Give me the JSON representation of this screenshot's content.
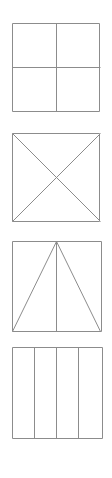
{
  "figure": {
    "background_color": "#ffffff",
    "line_color": "#8c8c8c",
    "line_width": 1,
    "canvas": {
      "width": 112,
      "height": 478
    },
    "panels": [
      {
        "id": "square-quartered",
        "label": "Square divided into four equal quarters",
        "partition_type": "cross",
        "parts": 4,
        "square": {
          "x": 12,
          "y": 23,
          "size": 88
        },
        "lines": [
          {
            "name": "vertical-center-line",
            "x1": 56,
            "y1": 23,
            "x2": 56,
            "y2": 111
          },
          {
            "name": "horizontal-center-line",
            "x1": 12,
            "y1": 67,
            "x2": 100,
            "y2": 67
          }
        ]
      },
      {
        "id": "square-diagonals",
        "label": "Square divided by both diagonals into four triangles",
        "partition_type": "x-diagonals",
        "parts": 4,
        "square": {
          "x": 12,
          "y": 133,
          "size": 88
        },
        "lines": [
          {
            "name": "diagonal-tl-br",
            "x1": 12,
            "y1": 133,
            "x2": 100,
            "y2": 221
          },
          {
            "name": "diagonal-tr-bl",
            "x1": 100,
            "y1": 133,
            "x2": 12,
            "y2": 221
          }
        ]
      },
      {
        "id": "square-apex-triangles",
        "label": "Square with apex at top center joined to bottom corners and a vertical center line",
        "partition_type": "apex-fan",
        "parts": 4,
        "square": {
          "x": 12,
          "y": 241,
          "size": 90
        },
        "lines": [
          {
            "name": "apex-to-bottom-left",
            "x1": 56,
            "y1": 241,
            "x2": 12,
            "y2": 331
          },
          {
            "name": "apex-to-bottom-right",
            "x1": 56,
            "y1": 241,
            "x2": 100,
            "y2": 331
          },
          {
            "name": "vertical-center-line",
            "x1": 56,
            "y1": 241,
            "x2": 56,
            "y2": 331
          }
        ]
      },
      {
        "id": "square-vertical-strips",
        "label": "Square divided into four equal vertical strips",
        "partition_type": "vertical-strips",
        "parts": 4,
        "square": {
          "x": 12,
          "y": 347,
          "size": 91
        },
        "lines": [
          {
            "name": "vertical-divider-1",
            "x1": 34,
            "y1": 347,
            "x2": 34,
            "y2": 438
          },
          {
            "name": "vertical-divider-2",
            "x1": 56,
            "y1": 347,
            "x2": 56,
            "y2": 438
          },
          {
            "name": "vertical-divider-3",
            "x1": 78,
            "y1": 347,
            "x2": 78,
            "y2": 438
          }
        ]
      }
    ]
  }
}
